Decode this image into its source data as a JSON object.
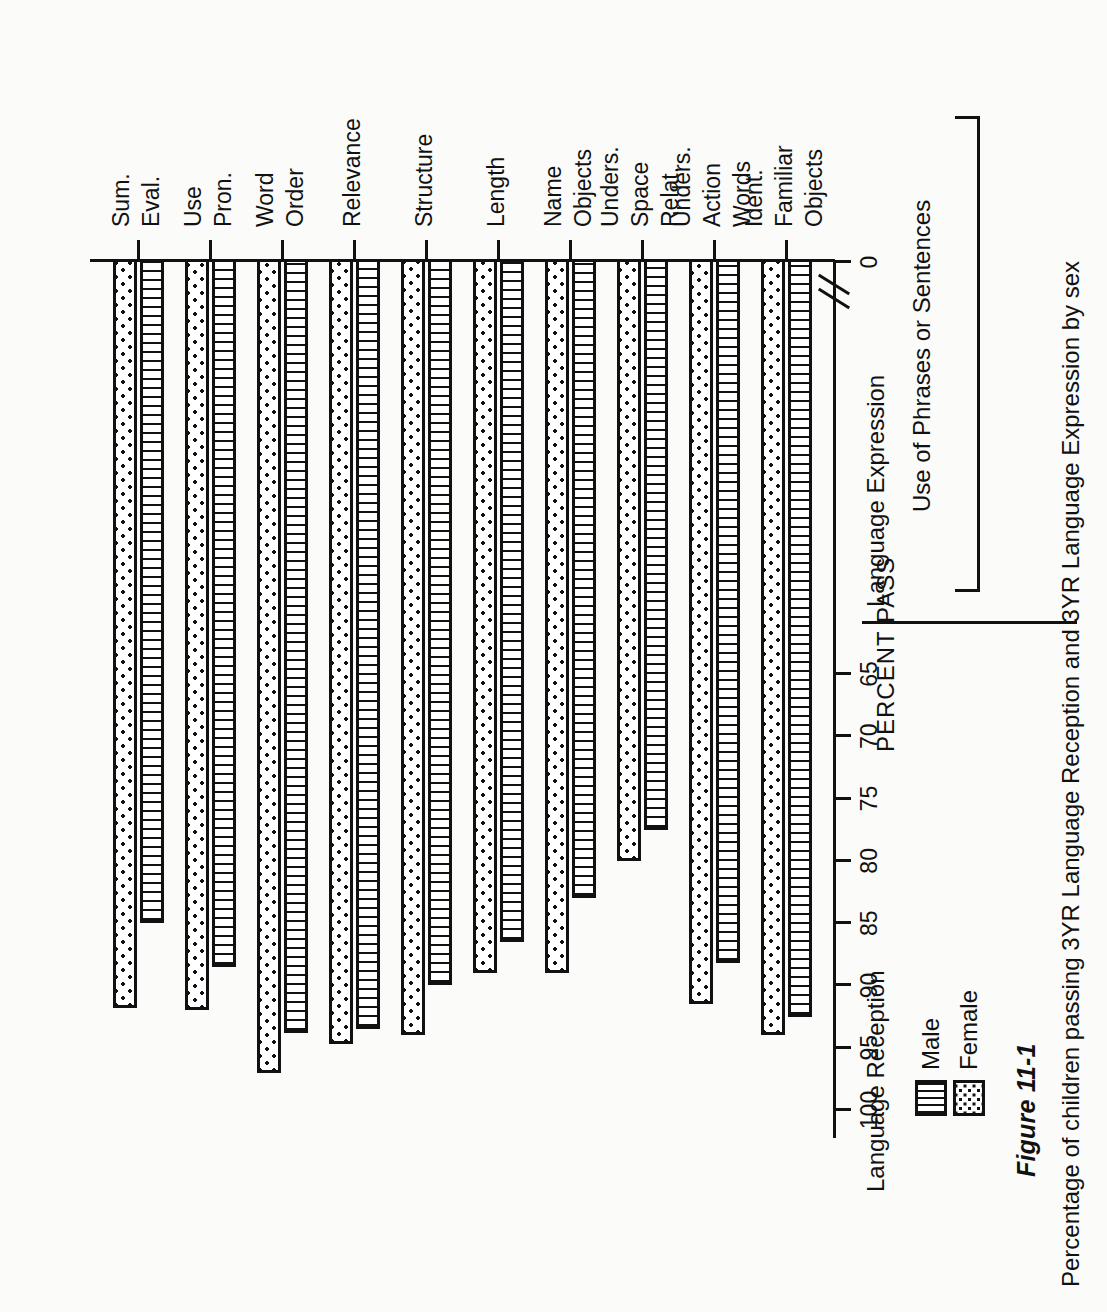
{
  "figure": {
    "number": "Figure 11-1",
    "subtitle": "Percentage of children passing 3YR Language Reception and 3YR Language Expression by sex"
  },
  "groups": {
    "reception": "Language Reception",
    "expression": "Language Expression",
    "phrases": "Use of Phrases or Sentences"
  },
  "legend": {
    "male": "Male",
    "female": "Female",
    "male_pattern": "vertical-lines",
    "female_pattern": "dotted-stipple"
  },
  "axis": {
    "caption": "PERCENT PASS",
    "ticks": [
      "100",
      "95",
      "90",
      "85",
      "80",
      "75",
      "70",
      "65",
      "0"
    ],
    "break_after": "65"
  },
  "chart_data": {
    "type": "bar",
    "orientation": "horizontal",
    "title": "Percentage of children passing 3YR Language Reception and 3YR Language Expression by sex",
    "xlabel": "PERCENT PASS",
    "ylabel": "",
    "xlim": [
      0,
      100
    ],
    "grid": false,
    "legend_position": "top-left",
    "categories": [
      "Ident. Familiar Objects",
      "Unders. Action Words",
      "Unders. Space Relat.",
      "Name Objects",
      "Length",
      "Structure",
      "Relevance",
      "Word Order",
      "Use Pron.",
      "Sum. Eval."
    ],
    "category_lines": [
      [
        "Ident.",
        "Familiar",
        "Objects"
      ],
      [
        "Unders.",
        "Action",
        "Words"
      ],
      [
        "Unders.",
        "Space",
        "Relat."
      ],
      [
        "Name",
        "Objects"
      ],
      [
        "Length"
      ],
      [
        "Structure"
      ],
      [
        "Relevance"
      ],
      [
        "Word",
        "Order"
      ],
      [
        "Use",
        "Pron."
      ],
      [
        "Sum.",
        "Eval."
      ]
    ],
    "groups_of_categories": {
      "Language Reception": [
        "Ident. Familiar Objects",
        "Unders. Action Words",
        "Unders. Space Relat."
      ],
      "Language Expression": [
        "Name Objects",
        "Length",
        "Structure",
        "Relevance",
        "Word Order",
        "Use Pron.",
        "Sum. Eval."
      ],
      "Use of Phrases or Sentences": [
        "Length",
        "Structure",
        "Relevance",
        "Word Order",
        "Use Pron.",
        "Sum. Eval."
      ]
    },
    "series": [
      {
        "name": "Male",
        "values": [
          92.5,
          88.2,
          77.5,
          83.0,
          86.5,
          90.0,
          93.5,
          93.8,
          88.5,
          85.0
        ]
      },
      {
        "name": "Female",
        "values": [
          94.0,
          91.5,
          80.0,
          89.0,
          89.0,
          94.0,
          94.7,
          97.0,
          92.0,
          91.8
        ]
      }
    ]
  }
}
